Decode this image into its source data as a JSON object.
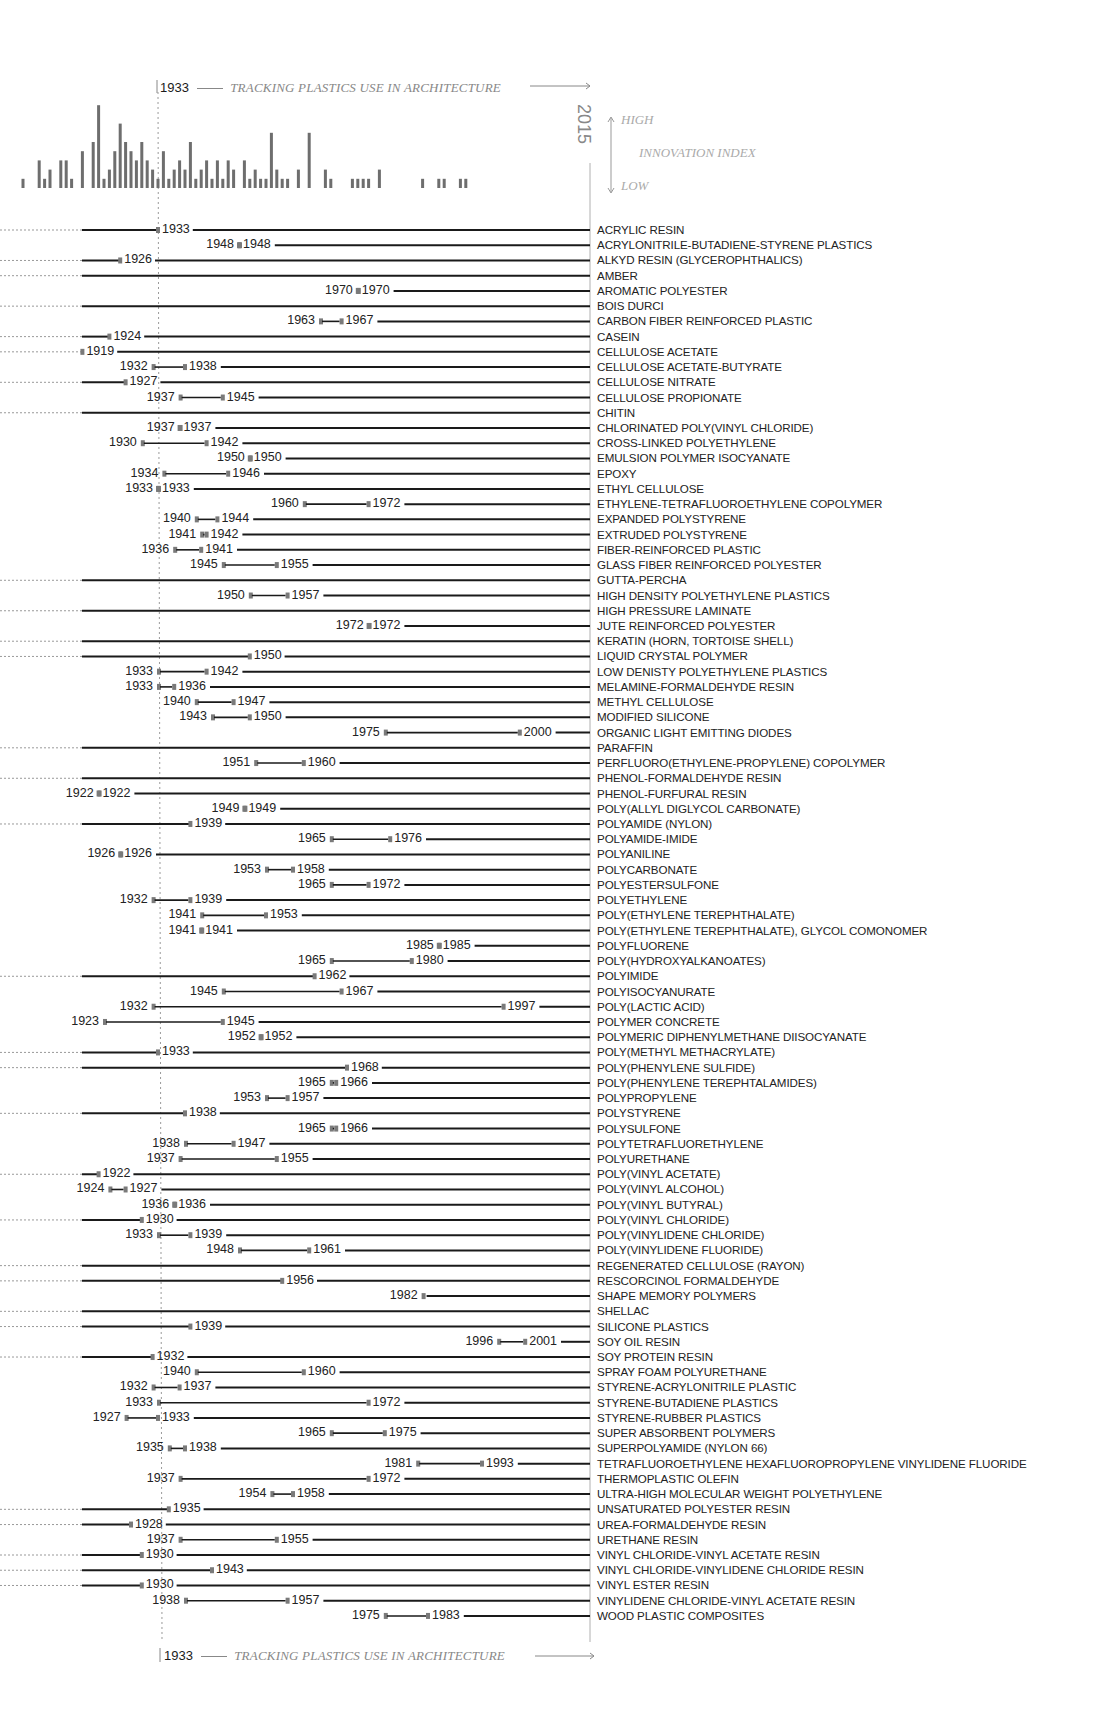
{
  "header": {
    "start_year": "1933",
    "title": "TRACKING PLASTICS USE IN ARCHITECTURE",
    "end_year": "2015",
    "legend_high": "HIGH",
    "legend_title": "INNOVATION INDEX",
    "legend_low": "LOW"
  },
  "footer": {
    "start_year": "1933",
    "title": "TRACKING PLASTICS USE IN ARCHITECTURE"
  },
  "colors": {
    "line": "#1a1a1a",
    "marker": "#7a7a7a",
    "bar": "#6e6e6e",
    "dotted": "#999999",
    "axis": "#b0b0b0"
  },
  "chart_data": {
    "type": "timeline",
    "title": "TRACKING PLASTICS USE IN ARCHITECTURE",
    "x_range": [
      1933,
      2015
    ],
    "reference_year": 1933,
    "end_year": 2015,
    "innovation_index": {
      "type": "bar",
      "label": "INNOVATION INDEX",
      "scale": [
        "LOW",
        "HIGH"
      ],
      "bars": [
        {
          "x": 1908,
          "h": 1
        },
        {
          "x": 1911,
          "h": 3
        },
        {
          "x": 1912,
          "h": 1
        },
        {
          "x": 1913,
          "h": 2
        },
        {
          "x": 1915,
          "h": 3
        },
        {
          "x": 1916,
          "h": 3
        },
        {
          "x": 1917,
          "h": 1
        },
        {
          "x": 1919,
          "h": 4
        },
        {
          "x": 1921,
          "h": 5
        },
        {
          "x": 1922,
          "h": 9
        },
        {
          "x": 1923,
          "h": 1
        },
        {
          "x": 1924,
          "h": 2
        },
        {
          "x": 1925,
          "h": 4
        },
        {
          "x": 1926,
          "h": 7
        },
        {
          "x": 1927,
          "h": 5
        },
        {
          "x": 1928,
          "h": 4
        },
        {
          "x": 1929,
          "h": 3
        },
        {
          "x": 1930,
          "h": 5
        },
        {
          "x": 1931,
          "h": 3
        },
        {
          "x": 1932,
          "h": 2
        },
        {
          "x": 1933,
          "h": 1
        },
        {
          "x": 1934,
          "h": 4
        },
        {
          "x": 1935,
          "h": 1
        },
        {
          "x": 1936,
          "h": 2
        },
        {
          "x": 1937,
          "h": 3
        },
        {
          "x": 1938,
          "h": 2
        },
        {
          "x": 1939,
          "h": 5
        },
        {
          "x": 1940,
          "h": 1
        },
        {
          "x": 1941,
          "h": 2
        },
        {
          "x": 1942,
          "h": 3
        },
        {
          "x": 1943,
          "h": 1
        },
        {
          "x": 1944,
          "h": 3
        },
        {
          "x": 1945,
          "h": 1
        },
        {
          "x": 1946,
          "h": 3
        },
        {
          "x": 1947,
          "h": 2
        },
        {
          "x": 1949,
          "h": 3
        },
        {
          "x": 1950,
          "h": 1
        },
        {
          "x": 1951,
          "h": 2
        },
        {
          "x": 1952,
          "h": 1
        },
        {
          "x": 1953,
          "h": 1
        },
        {
          "x": 1954,
          "h": 6
        },
        {
          "x": 1955,
          "h": 2
        },
        {
          "x": 1956,
          "h": 1
        },
        {
          "x": 1957,
          "h": 1
        },
        {
          "x": 1959,
          "h": 2
        },
        {
          "x": 1961,
          "h": 6
        },
        {
          "x": 1964,
          "h": 2
        },
        {
          "x": 1965,
          "h": 1
        },
        {
          "x": 1969,
          "h": 1
        },
        {
          "x": 1970,
          "h": 1
        },
        {
          "x": 1971,
          "h": 1
        },
        {
          "x": 1972,
          "h": 1
        },
        {
          "x": 1974,
          "h": 2
        },
        {
          "x": 1982,
          "h": 1
        },
        {
          "x": 1985,
          "h": 1
        },
        {
          "x": 1986,
          "h": 1
        },
        {
          "x": 1989,
          "h": 1
        },
        {
          "x": 1990,
          "h": 1
        }
      ]
    },
    "materials": [
      {
        "name": "ACRYLIC RESIN",
        "start": null,
        "end": "1933",
        "line_from_left": true
      },
      {
        "name": "ACRYLONITRILE-BUTADIENE-STYRENE PLASTICS",
        "start": "1948",
        "end": "1948"
      },
      {
        "name": "ALKYD RESIN (GLYCEROPHTHALICS)",
        "start": null,
        "end": "1926",
        "line_from_left": true
      },
      {
        "name": "AMBER",
        "start": null,
        "end": null,
        "line_from_left": true
      },
      {
        "name": "AROMATIC POLYESTER",
        "start": "1970",
        "end": "1970"
      },
      {
        "name": "BOIS DURCI",
        "start": null,
        "end": null,
        "line_from_left": true
      },
      {
        "name": "CARBON FIBER REINFORCED PLASTIC",
        "start": "1963",
        "end": "1967"
      },
      {
        "name": "CASEIN",
        "start": null,
        "end": "1924",
        "line_from_left": true
      },
      {
        "name": "CELLULOSE ACETATE",
        "start": null,
        "end": "1919",
        "line_from_left": true
      },
      {
        "name": "CELLULOSE ACETATE-BUTYRATE",
        "start": "1932",
        "end": "1938"
      },
      {
        "name": "CELLULOSE NITRATE",
        "start": null,
        "end": "1927",
        "line_from_left": true
      },
      {
        "name": "CELLULOSE PROPIONATE",
        "start": "1937",
        "end": "1945"
      },
      {
        "name": "CHITIN",
        "start": null,
        "end": null,
        "line_from_left": true
      },
      {
        "name": "CHLORINATED POLY(VINYL CHLORIDE)",
        "start": "1937",
        "end": "1937"
      },
      {
        "name": "CROSS-LINKED POLYETHYLENE",
        "start": "1930",
        "end": "1942"
      },
      {
        "name": "EMULSION POLYMER ISOCYANATE",
        "start": "1950",
        "end": "1950"
      },
      {
        "name": "EPOXY",
        "start": "1934",
        "end": "1946"
      },
      {
        "name": "ETHYL CELLULOSE",
        "start": "1933",
        "end": "1933"
      },
      {
        "name": "ETHYLENE-TETRAFLUOROETHYLENE COPOLYMER",
        "start": "1960",
        "end": "1972"
      },
      {
        "name": "EXPANDED POLYSTYRENE",
        "start": "1940",
        "end": "1944"
      },
      {
        "name": "EXTRUDED POLYSTYRENE",
        "start": "1941",
        "end": "1942"
      },
      {
        "name": "FIBER-REINFORCED PLASTIC",
        "start": "1936",
        "end": "1941"
      },
      {
        "name": "GLASS FIBER REINFORCED POLYESTER",
        "start": "1945",
        "end": "1955"
      },
      {
        "name": "GUTTA-PERCHA",
        "start": null,
        "end": null,
        "line_from_left": true
      },
      {
        "name": "HIGH DENSITY POLYETHYLENE PLASTICS",
        "start": "1950",
        "end": "1957"
      },
      {
        "name": "HIGH PRESSURE LAMINATE",
        "start": null,
        "end": null,
        "line_from_left": true
      },
      {
        "name": "JUTE REINFORCED POLYESTER",
        "start": "1972",
        "end": "1972"
      },
      {
        "name": "KERATIN (HORN, TORTOISE SHELL)",
        "start": null,
        "end": null,
        "line_from_left": true
      },
      {
        "name": "LIQUID CRYSTAL POLYMER",
        "start": null,
        "end": "1950",
        "line_from_left": true
      },
      {
        "name": "LOW DENISTY POLYETHYLENE PLASTICS",
        "start": "1933",
        "end": "1942"
      },
      {
        "name": "MELAMINE-FORMALDEHYDE RESIN",
        "start": "1933",
        "end": "1936"
      },
      {
        "name": "METHYL CELLULOSE",
        "start": "1940",
        "end": "1947"
      },
      {
        "name": "MODIFIED SILICONE",
        "start": "1943",
        "end": "1950"
      },
      {
        "name": "ORGANIC LIGHT EMITTING DIODES",
        "start": "1975",
        "end": "2000"
      },
      {
        "name": "PARAFFIN",
        "start": null,
        "end": null,
        "line_from_left": true
      },
      {
        "name": "PERFLUORO(ETHYLENE-PROPYLENE) COPOLYMER",
        "start": "1951",
        "end": "1960"
      },
      {
        "name": "PHENOL-FORMALDEHYDE RESIN",
        "start": null,
        "end": null,
        "line_from_left": true
      },
      {
        "name": "PHENOL-FURFURAL RESIN",
        "start": "1922",
        "end": "1922"
      },
      {
        "name": "POLY(ALLYL DIGLYCOL CARBONATE)",
        "start": "1949",
        "end": "1949"
      },
      {
        "name": "POLYAMIDE (NYLON)",
        "start": null,
        "end": "1939",
        "line_from_left": true
      },
      {
        "name": "POLYAMIDE-IMIDE",
        "start": "1965",
        "end": "1976"
      },
      {
        "name": "POLYANILINE",
        "start": "1926",
        "end": "1926"
      },
      {
        "name": "POLYCARBONATE",
        "start": "1953",
        "end": "1958"
      },
      {
        "name": "POLYESTERSULFONE",
        "start": "1965",
        "end": "1972"
      },
      {
        "name": "POLYETHYLENE",
        "start": "1932",
        "end": "1939"
      },
      {
        "name": "POLY(ETHYLENE TEREPHTHALATE)",
        "start": "1941",
        "end": "1953"
      },
      {
        "name": "POLY(ETHYLENE TEREPHTHALATE), GLYCOL COMONOMER",
        "start": "1941",
        "end": "1941"
      },
      {
        "name": "POLYFLUORENE",
        "start": "1985",
        "end": "1985"
      },
      {
        "name": "POLY(HYDROXYALKANOATES)",
        "start": "1965",
        "end": "1980"
      },
      {
        "name": "POLYIMIDE",
        "start": null,
        "end": "1962",
        "line_from_left": true
      },
      {
        "name": "POLYISOCYANURATE",
        "start": "1945",
        "end": "1967"
      },
      {
        "name": "POLY(LACTIC ACID)",
        "start": "1932",
        "end": "1997"
      },
      {
        "name": "POLYMER CONCRETE",
        "start": "1923",
        "end": "1945"
      },
      {
        "name": "POLYMERIC DIPHENYLMETHANE DIISOCYANATE",
        "start": "1952",
        "end": "1952"
      },
      {
        "name": "POLY(METHYL METHACRYLATE)",
        "start": null,
        "end": "1933",
        "line_from_left": true
      },
      {
        "name": "POLY(PHENYLENE SULFIDE)",
        "start": null,
        "end": "1968",
        "line_from_left": true
      },
      {
        "name": "POLY(PHENYLENE TEREPHTALAMIDES)",
        "start": "1965",
        "end": "1966"
      },
      {
        "name": "POLYPROPYLENE",
        "start": "1953",
        "end": "1957"
      },
      {
        "name": "POLYSTYRENE",
        "start": null,
        "end": "1938",
        "line_from_left": true
      },
      {
        "name": "POLYSULFONE",
        "start": "1965",
        "end": "1966"
      },
      {
        "name": "POLYTETRAFLUORETHYLENE",
        "start": "1938",
        "end": "1947"
      },
      {
        "name": "POLYURETHANE",
        "start": "1937",
        "end": "1955"
      },
      {
        "name": "POLY(VINYL ACETATE)",
        "start": null,
        "end": "1922",
        "line_from_left": true
      },
      {
        "name": "POLY(VINYL ALCOHOL)",
        "start": "1924",
        "end": "1927"
      },
      {
        "name": "POLY(VINYL BUTYRAL)",
        "start": "1936",
        "end": "1936"
      },
      {
        "name": "POLY(VINYL CHLORIDE)",
        "start": null,
        "end": "1930",
        "line_from_left": true
      },
      {
        "name": "POLY(VINYLIDENE CHLORIDE)",
        "start": "1933",
        "end": "1939"
      },
      {
        "name": "POLY(VINYLIDENE FLUORIDE)",
        "start": "1948",
        "end": "1961"
      },
      {
        "name": "REGENERATED CELLULOSE (RAYON)",
        "start": null,
        "end": null,
        "line_from_left": true
      },
      {
        "name": "RESCORCINOL FORMALDEHYDE",
        "start": null,
        "end": "1956",
        "line_from_left": true
      },
      {
        "name": "SHAPE MEMORY POLYMERS",
        "start": "1982",
        "end": null
      },
      {
        "name": "SHELLAC",
        "start": null,
        "end": null,
        "line_from_left": true
      },
      {
        "name": "SILICONE PLASTICS",
        "start": null,
        "end": "1939",
        "line_from_left": true
      },
      {
        "name": "SOY OIL RESIN",
        "start": "1996",
        "end": "2001"
      },
      {
        "name": "SOY PROTEIN RESIN",
        "start": null,
        "end": "1932",
        "line_from_left": true
      },
      {
        "name": "SPRAY FOAM POLYURETHANE",
        "start": "1940",
        "end": "1960"
      },
      {
        "name": "STYRENE-ACRYLONITRILE PLASTIC",
        "start": "1932",
        "end": "1937"
      },
      {
        "name": "STYRENE-BUTADIENE PLASTICS",
        "start": "1933",
        "end": "1972"
      },
      {
        "name": "STYRENE-RUBBER PLASTICS",
        "start": "1927",
        "end": "1933"
      },
      {
        "name": "SUPER ABSORBENT POLYMERS",
        "start": "1965",
        "end": "1975"
      },
      {
        "name": "SUPERPOLYAMIDE (NYLON 66)",
        "start": "1935",
        "end": "1938"
      },
      {
        "name": "TETRAFLUOROETHYLENE HEXAFLUOROPROPYLENE VINYLIDENE FLUORIDE",
        "start": "1981",
        "end": "1993"
      },
      {
        "name": "THERMOPLASTIC OLEFIN",
        "start": "1937",
        "end": "1972"
      },
      {
        "name": "ULTRA-HIGH MOLECULAR WEIGHT POLYETHYLENE",
        "start": "1954",
        "end": "1958"
      },
      {
        "name": "UNSATURATED POLYESTER RESIN",
        "start": null,
        "end": "1935",
        "line_from_left": true
      },
      {
        "name": "UREA-FORMALDEHYDE RESIN",
        "start": null,
        "end": "1928",
        "line_from_left": true
      },
      {
        "name": "URETHANE RESIN",
        "start": "1937",
        "end": "1955"
      },
      {
        "name": "VINYL CHLORIDE-VINYL ACETATE RESIN",
        "start": null,
        "end": "1930",
        "line_from_left": true
      },
      {
        "name": "VINYL CHLORIDE-VINYLIDENE CHLORIDE RESIN",
        "start": null,
        "end": "1943",
        "line_from_left": true
      },
      {
        "name": "VINYL ESTER RESIN",
        "start": null,
        "end": "1930",
        "line_from_left": true
      },
      {
        "name": "VINYLIDENE CHLORIDE-VINYL ACETATE RESIN",
        "start": "1938",
        "end": "1957"
      },
      {
        "name": "WOOD PLASTIC COMPOSITES",
        "start": "1975",
        "end": "1983"
      }
    ]
  }
}
